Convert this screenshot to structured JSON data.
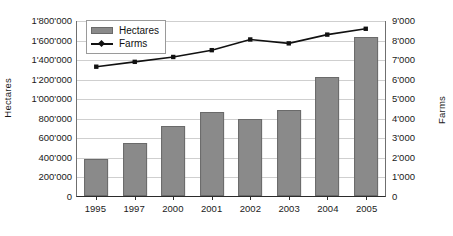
{
  "chart_data": {
    "type": "bar",
    "title": "",
    "subtitle": "",
    "xlabel": "",
    "ylabel": "Hectares",
    "y2label": "Farms",
    "grid": true,
    "legend_position": "top-left",
    "categories": [
      "1995",
      "1997",
      "2000",
      "2001",
      "2002",
      "2003",
      "2004",
      "2005"
    ],
    "ylim": [
      0,
      1800000
    ],
    "yticks": [
      "0",
      "200'000",
      "400'000",
      "600'000",
      "800'000",
      "1'000'000",
      "1'200'000",
      "1'400'000",
      "1'600'000",
      "1'800'000"
    ],
    "ytick_values": [
      0,
      200000,
      400000,
      600000,
      800000,
      1000000,
      1200000,
      1400000,
      1600000,
      1800000
    ],
    "y2lim": [
      0,
      9000
    ],
    "y2ticks": [
      "0",
      "1'000",
      "2'000",
      "3'000",
      "4'000",
      "5'000",
      "6'000",
      "7'000",
      "8'000",
      "9'000"
    ],
    "y2tick_values": [
      0,
      1000,
      2000,
      3000,
      4000,
      5000,
      6000,
      7000,
      8000,
      9000
    ],
    "series": [
      {
        "name": "Hectares",
        "type": "bar",
        "axis": "left",
        "color": "#8a8a8a",
        "values": [
          375000,
          545000,
          720000,
          855000,
          790000,
          880000,
          1220000,
          1630000
        ]
      },
      {
        "name": "Farms",
        "type": "line",
        "axis": "right",
        "color": "#111111",
        "values": [
          6650,
          6900,
          7150,
          7500,
          8050,
          7850,
          8300,
          8600
        ]
      }
    ]
  },
  "legend": {
    "items": [
      {
        "label": "Hectares"
      },
      {
        "label": "Farms"
      }
    ]
  },
  "colors": {
    "bar": "#8a8a8a",
    "bar_border": "#6a6a6a",
    "line": "#111111",
    "grid": "#cfcfcf",
    "axis": "#2b2b2b",
    "background": "#ffffff"
  }
}
